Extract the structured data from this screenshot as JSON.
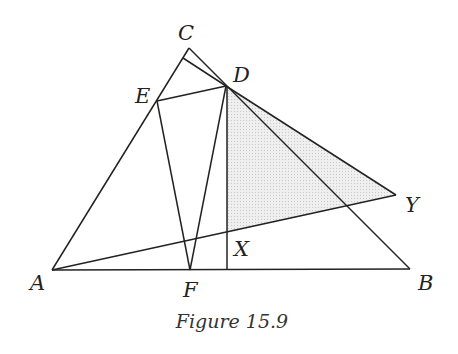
{
  "figure": {
    "caption": "Figure 15.9",
    "points": {
      "A": {
        "label": "A",
        "x": 52,
        "y": 270
      },
      "B": {
        "label": "B",
        "x": 410,
        "y": 269
      },
      "C": {
        "label": "C",
        "x": 189,
        "y": 48
      },
      "D": {
        "label": "D",
        "x": 226,
        "y": 86
      },
      "E": {
        "label": "E",
        "x": 157,
        "y": 101
      },
      "F": {
        "label": "F",
        "x": 190,
        "y": 270
      },
      "X": {
        "label": "X",
        "x": 227,
        "y": 233
      },
      "Y": {
        "label": "Y",
        "x": 396,
        "y": 195
      }
    },
    "shaded_region": "triangle DXY",
    "colors": {
      "line": "#222222",
      "shade": "#e4e4e4"
    }
  }
}
